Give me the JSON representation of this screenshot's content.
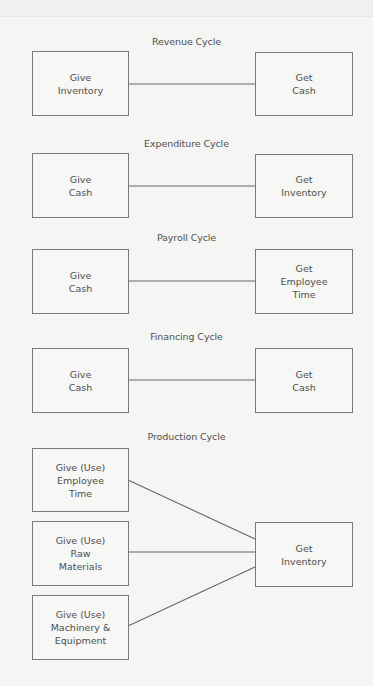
{
  "diagram": {
    "cycles": [
      {
        "title": "Revenue Cycle",
        "give": [
          "Give\nInventory"
        ],
        "get": "Get\nCash"
      },
      {
        "title": "Expenditure Cycle",
        "give": [
          "Give\nCash"
        ],
        "get": "Get\nInventory"
      },
      {
        "title": "Payroll Cycle",
        "give": [
          "Give\nCash"
        ],
        "get": "Get\nEmployee\nTime"
      },
      {
        "title": "Financing Cycle",
        "give": [
          "Give\nCash"
        ],
        "get": "Get\nCash"
      },
      {
        "title": "Production Cycle",
        "give": [
          "Give (Use)\nEmployee\nTime",
          "Give (Use)\nRaw\nMaterials",
          "Give (Use)\nMachinery &\nEquipment"
        ],
        "get": "Get\nInventory"
      }
    ]
  }
}
